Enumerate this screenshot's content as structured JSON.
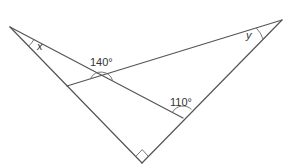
{
  "diagram": {
    "type": "geometry",
    "colors": {
      "line": "#555555",
      "label": "#333333",
      "background": "#ffffff"
    },
    "points": {
      "A": {
        "x": 10,
        "y": 27
      },
      "B": {
        "x": 282,
        "y": 20
      },
      "C": {
        "x": 142,
        "y": 163
      },
      "D": {
        "x": 183,
        "y": 118
      },
      "E": {
        "x": 67,
        "y": 86
      },
      "P": {
        "x": 102,
        "y": 75
      }
    },
    "segments": [
      {
        "from": "A",
        "to": "C"
      },
      {
        "from": "B",
        "to": "C"
      },
      {
        "from": "A",
        "to": "D"
      },
      {
        "from": "B",
        "to": "E"
      }
    ],
    "angles": {
      "x": {
        "label": "x",
        "vertex": "A",
        "kind": "unknown"
      },
      "y": {
        "label": "y",
        "vertex": "B",
        "kind": "unknown"
      },
      "intersection": {
        "label": "140°",
        "vertex": "P",
        "value": 140
      },
      "at_d": {
        "label": "110°",
        "vertex": "D",
        "value": 110
      },
      "right": {
        "label": "",
        "vertex": "C",
        "value": 90,
        "marker": "right-angle-square"
      }
    }
  }
}
